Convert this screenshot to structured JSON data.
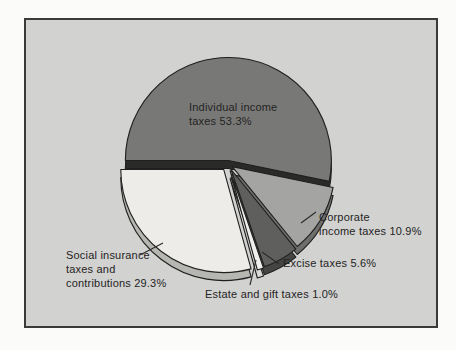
{
  "figure": {
    "panel_background": "#d2d2d0",
    "panel_border_color": "#3a3a3a",
    "page_background": "#fbfbfa",
    "outline_color": "#1f1f1f",
    "text_color": "#242424"
  },
  "chart_data": {
    "type": "pie",
    "title": "",
    "legend_position": "none",
    "labels_as_callouts": true,
    "start_angle_deg": 180,
    "direction": "clockwise",
    "slices": [
      {
        "name": "individual-income-taxes",
        "label": "Individual income\ntaxes 53.3%",
        "category": "Individual income taxes",
        "value": 53.3,
        "top_color": "#787876",
        "side_color": "#2a2a28"
      },
      {
        "name": "corporate-income-taxes",
        "label": "Corporate\nincome taxes 10.9%",
        "category": "Corporate income taxes",
        "value": 10.9,
        "top_color": "#a4a4a2",
        "side_color": "#6e6e6c"
      },
      {
        "name": "excise-taxes",
        "label": "Excise taxes 5.6%",
        "category": "Excise taxes",
        "value": 5.6,
        "top_color": "#5f5f5d",
        "side_color": "#454543"
      },
      {
        "name": "estate-and-gift-taxes",
        "label": "Estate and gift taxes 1.0%",
        "category": "Estate and gift taxes",
        "value": 1.0,
        "top_color": "#efefec",
        "side_color": "#d9d9d5"
      },
      {
        "name": "social-insurance",
        "label": "Social insurance\ntaxes and\ncontributions 29.3%",
        "category": "Social insurance taxes and contributions",
        "value": 29.3,
        "top_color": "#edece8",
        "side_color": "#b6b6b2"
      }
    ]
  }
}
